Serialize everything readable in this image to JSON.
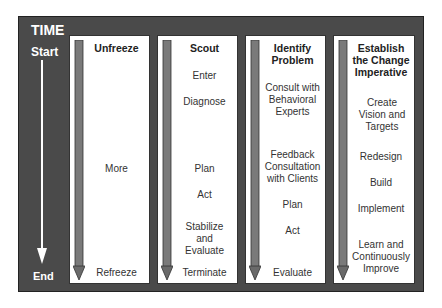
{
  "diagram": {
    "time_axis": {
      "title": "TIME",
      "start": "Start",
      "end": "End"
    },
    "columns": [
      {
        "title": "Unfreeze",
        "steps": [
          {
            "text": "More",
            "top": 127
          },
          {
            "text": "Refreeze",
            "top": 231
          }
        ]
      },
      {
        "title": "Scout",
        "steps": [
          {
            "text": "Enter",
            "top": 34
          },
          {
            "text": "Diagnose",
            "top": 60
          },
          {
            "text": "Plan",
            "top": 127
          },
          {
            "text": "Act",
            "top": 153
          },
          {
            "text": "Stabilize and Evaluate",
            "top": 185
          },
          {
            "text": "Terminate",
            "top": 231
          }
        ]
      },
      {
        "title": "Identify Problem",
        "steps": [
          {
            "text": "Consult with Behavioral Experts",
            "top": 46
          },
          {
            "text": "Feedback Consultation with Clients",
            "top": 113
          },
          {
            "text": "Plan",
            "top": 163
          },
          {
            "text": "Act",
            "top": 189
          },
          {
            "text": "Evaluate",
            "top": 231
          }
        ]
      },
      {
        "title": "Establish the Change Imperative",
        "steps": [
          {
            "text": "Create Vision and Targets",
            "top": 61
          },
          {
            "text": "Redesign",
            "top": 115
          },
          {
            "text": "Build",
            "top": 141
          },
          {
            "text": "Implement",
            "top": 167
          },
          {
            "text": "Learn and Continuously Improve",
            "top": 203
          }
        ]
      }
    ]
  },
  "colors": {
    "frame": "#4a4a4a",
    "column_bg": "#ffffff",
    "arrow": "#7a7a7a",
    "time_arrow": "#ffffff"
  }
}
